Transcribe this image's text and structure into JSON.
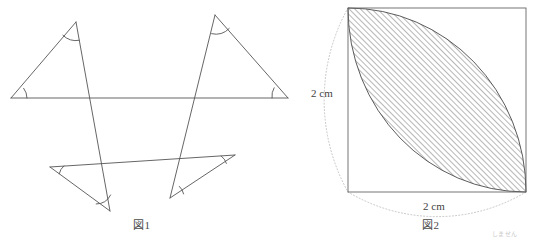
{
  "page": {
    "background_color": "#ffffff",
    "line_color": "#555555",
    "hatch_color": "#4a4a4a",
    "dotted_color": "#b0b0b0",
    "width": 535,
    "height": 241
  },
  "figure1": {
    "caption": "図1",
    "description": "four-triangles-crossing-lines-diagram",
    "shapes": [
      {
        "name": "upper-left-triangle",
        "points": "11,98 76,22 110,211",
        "marked_angles": [
          "left-base-angle",
          "apex-angle"
        ]
      },
      {
        "name": "upper-right-triangle",
        "points": "288,98 215,15 170,198",
        "marked_angles": [
          "right-base-angle",
          "apex-angle"
        ]
      },
      {
        "name": "long-horizontal-line",
        "points": "11,98 288,98"
      },
      {
        "name": "lower-slanted-line",
        "points": "50,167 235,155"
      },
      {
        "name": "lower-left-triangle",
        "points": "50,167 110,211 235,155"
      },
      {
        "name": "lower-right-triangle",
        "points": "235,155 170,198 50,167"
      }
    ]
  },
  "figure2": {
    "caption": "図2",
    "description": "square-with-hatched-vesica-lens",
    "square": {
      "x": 348,
      "y": 8,
      "width": 178,
      "height": 184
    },
    "dimension_left": "2 cm",
    "dimension_bottom": "2 cm",
    "hatch_angle_degrees": 45,
    "lens": {
      "name": "vesica-piscis-hatched-region",
      "from_corner": "top-left",
      "to_corner": "bottom-right"
    }
  },
  "footnote": {
    "text": "しません"
  }
}
